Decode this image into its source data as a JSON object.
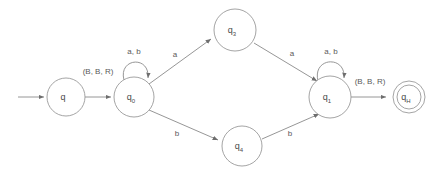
{
  "diagram": {
    "type": "state-transition-diagram",
    "colors": {
      "background": "#ffffff",
      "stroke": "#9a9a9a",
      "text": "#4a4a4a",
      "edge": "#8a8a8a"
    },
    "states": [
      {
        "id": "q",
        "base": "q",
        "sub": "",
        "cx": 66,
        "cy": 97,
        "r": 19,
        "accepting": false,
        "start": true
      },
      {
        "id": "q0",
        "base": "q",
        "sub": "0",
        "cx": 134,
        "cy": 97,
        "r": 20,
        "accepting": false,
        "start": false
      },
      {
        "id": "q3",
        "base": "q",
        "sub": "3",
        "cx": 235,
        "cy": 30,
        "r": 21,
        "accepting": false,
        "start": false
      },
      {
        "id": "q4",
        "base": "q",
        "sub": "4",
        "cx": 242,
        "cy": 146,
        "r": 20,
        "accepting": false,
        "start": false
      },
      {
        "id": "q1",
        "base": "q",
        "sub": "1",
        "cx": 330,
        "cy": 97,
        "r": 21,
        "accepting": false,
        "start": false
      },
      {
        "id": "qH",
        "base": "q",
        "sub": "H",
        "cx": 409,
        "cy": 97,
        "r": 16,
        "accepting": true,
        "start": false
      }
    ],
    "transitions": [
      {
        "from": "start",
        "to": "q",
        "label": "",
        "kind": "start-arrow"
      },
      {
        "from": "q",
        "to": "q0",
        "label": "(B, B, R)",
        "kind": "straight"
      },
      {
        "from": "q0",
        "to": "q0",
        "label": "a, b",
        "kind": "self-loop"
      },
      {
        "from": "q0",
        "to": "q3",
        "label": "a",
        "kind": "diagonal-up"
      },
      {
        "from": "q0",
        "to": "q4",
        "label": "b",
        "kind": "diagonal-down"
      },
      {
        "from": "q3",
        "to": "q1",
        "label": "a",
        "kind": "diagonal-down"
      },
      {
        "from": "q4",
        "to": "q1",
        "label": "b",
        "kind": "diagonal-up"
      },
      {
        "from": "q1",
        "to": "q1",
        "label": "a, b",
        "kind": "self-loop"
      },
      {
        "from": "q1",
        "to": "qH",
        "label": "(B, B, R)",
        "kind": "straight"
      }
    ],
    "labels": {
      "start_transition": "(B, B, R)",
      "halt_transition": "(B, B, R)",
      "loop_q0": "a, b",
      "loop_q1": "a, b",
      "q0_to_q3": "a",
      "q0_to_q4": "b",
      "q3_to_q1": "a",
      "q4_to_q1": "b"
    }
  }
}
